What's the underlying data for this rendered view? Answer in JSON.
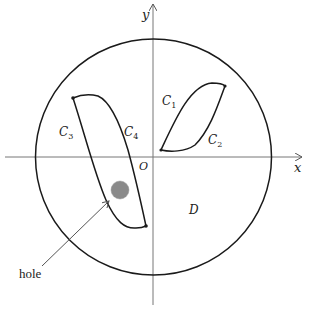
{
  "diagram": {
    "type": "region-with-curves",
    "axes": {
      "x_label": "x",
      "y_label": "y",
      "origin_label": "O"
    },
    "region_label": "D",
    "curves": [
      {
        "id": "C1",
        "label": "C",
        "sub": "1"
      },
      {
        "id": "C2",
        "label": "C",
        "sub": "2"
      },
      {
        "id": "C3",
        "label": "C",
        "sub": "3"
      },
      {
        "id": "C4",
        "label": "C",
        "sub": "4"
      }
    ],
    "annotation": {
      "label": "hole"
    },
    "colors": {
      "line": "#1a1a1a",
      "axis": "#777777",
      "hole_fill": "#8a8a8a"
    }
  }
}
